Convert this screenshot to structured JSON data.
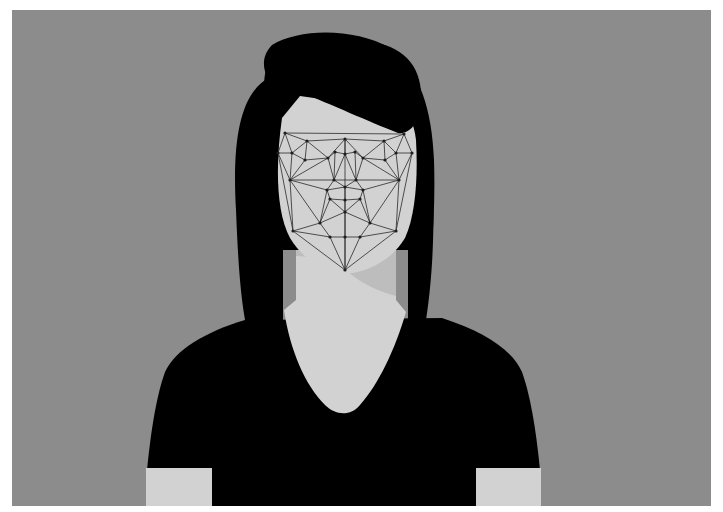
{
  "image": {
    "description": "Flat grayscale illustration of a woman with long dark hair in a black V-neck t-shirt; her face is overlaid with a facial-recognition landmark mesh of dots connected by lines.",
    "colors": {
      "page_background": "#ffffff",
      "panel_background": "#8c8c8c",
      "hair": "#000000",
      "shirt": "#000000",
      "skin": "#d2d2d2",
      "skin_shadow": "#bdbdbd",
      "mesh_line": "#2a2a2a",
      "mesh_node": "#1e1e1e"
    },
    "mesh": {
      "nodes": [
        [
          285,
          133
        ],
        [
          307,
          141
        ],
        [
          345,
          139
        ],
        [
          384,
          141
        ],
        [
          404,
          134
        ],
        [
          278,
          153
        ],
        [
          292,
          153
        ],
        [
          335,
          152
        ],
        [
          345,
          154
        ],
        [
          355,
          152
        ],
        [
          396,
          153
        ],
        [
          412,
          153
        ],
        [
          305,
          160
        ],
        [
          328,
          158
        ],
        [
          363,
          158
        ],
        [
          385,
          160
        ],
        [
          290,
          180
        ],
        [
          334,
          180
        ],
        [
          356,
          180
        ],
        [
          399,
          180
        ],
        [
          327,
          190
        ],
        [
          345,
          187
        ],
        [
          363,
          190
        ],
        [
          330,
          199
        ],
        [
          345,
          200
        ],
        [
          360,
          199
        ],
        [
          345,
          212
        ],
        [
          320,
          223
        ],
        [
          370,
          223
        ],
        [
          293,
          231
        ],
        [
          396,
          231
        ],
        [
          330,
          237
        ],
        [
          345,
          237
        ],
        [
          360,
          237
        ],
        [
          345,
          270
        ]
      ],
      "edges": [
        [
          0,
          1
        ],
        [
          1,
          2
        ],
        [
          2,
          3
        ],
        [
          3,
          4
        ],
        [
          0,
          4
        ],
        [
          0,
          5
        ],
        [
          0,
          6
        ],
        [
          1,
          6
        ],
        [
          1,
          12
        ],
        [
          1,
          13
        ],
        [
          2,
          13
        ],
        [
          2,
          8
        ],
        [
          2,
          14
        ],
        [
          3,
          14
        ],
        [
          3,
          15
        ],
        [
          3,
          10
        ],
        [
          4,
          10
        ],
        [
          4,
          11
        ],
        [
          5,
          6
        ],
        [
          6,
          12
        ],
        [
          12,
          13
        ],
        [
          13,
          7
        ],
        [
          7,
          8
        ],
        [
          8,
          9
        ],
        [
          9,
          14
        ],
        [
          14,
          15
        ],
        [
          15,
          10
        ],
        [
          10,
          11
        ],
        [
          5,
          16
        ],
        [
          6,
          16
        ],
        [
          12,
          16
        ],
        [
          13,
          16
        ],
        [
          7,
          17
        ],
        [
          13,
          17
        ],
        [
          8,
          17
        ],
        [
          8,
          18
        ],
        [
          9,
          18
        ],
        [
          14,
          18
        ],
        [
          15,
          19
        ],
        [
          14,
          19
        ],
        [
          10,
          19
        ],
        [
          11,
          19
        ],
        [
          16,
          17
        ],
        [
          17,
          18
        ],
        [
          18,
          19
        ],
        [
          16,
          20
        ],
        [
          17,
          20
        ],
        [
          17,
          21
        ],
        [
          18,
          21
        ],
        [
          18,
          22
        ],
        [
          19,
          22
        ],
        [
          20,
          21
        ],
        [
          21,
          22
        ],
        [
          20,
          23
        ],
        [
          21,
          24
        ],
        [
          22,
          25
        ],
        [
          23,
          24
        ],
        [
          24,
          25
        ],
        [
          23,
          26
        ],
        [
          24,
          26
        ],
        [
          25,
          26
        ],
        [
          16,
          27
        ],
        [
          20,
          27
        ],
        [
          23,
          27
        ],
        [
          26,
          27
        ],
        [
          19,
          28
        ],
        [
          22,
          28
        ],
        [
          25,
          28
        ],
        [
          26,
          28
        ],
        [
          16,
          29
        ],
        [
          5,
          29
        ],
        [
          27,
          29
        ],
        [
          19,
          30
        ],
        [
          11,
          30
        ],
        [
          28,
          30
        ],
        [
          27,
          31
        ],
        [
          29,
          31
        ],
        [
          31,
          32
        ],
        [
          32,
          33
        ],
        [
          28,
          33
        ],
        [
          30,
          33
        ],
        [
          26,
          32
        ],
        [
          29,
          34
        ],
        [
          31,
          34
        ],
        [
          32,
          34
        ],
        [
          33,
          34
        ],
        [
          30,
          34
        ],
        [
          2,
          8
        ],
        [
          8,
          21
        ],
        [
          21,
          24
        ],
        [
          24,
          26
        ],
        [
          26,
          32
        ],
        [
          32,
          34
        ]
      ]
    }
  }
}
